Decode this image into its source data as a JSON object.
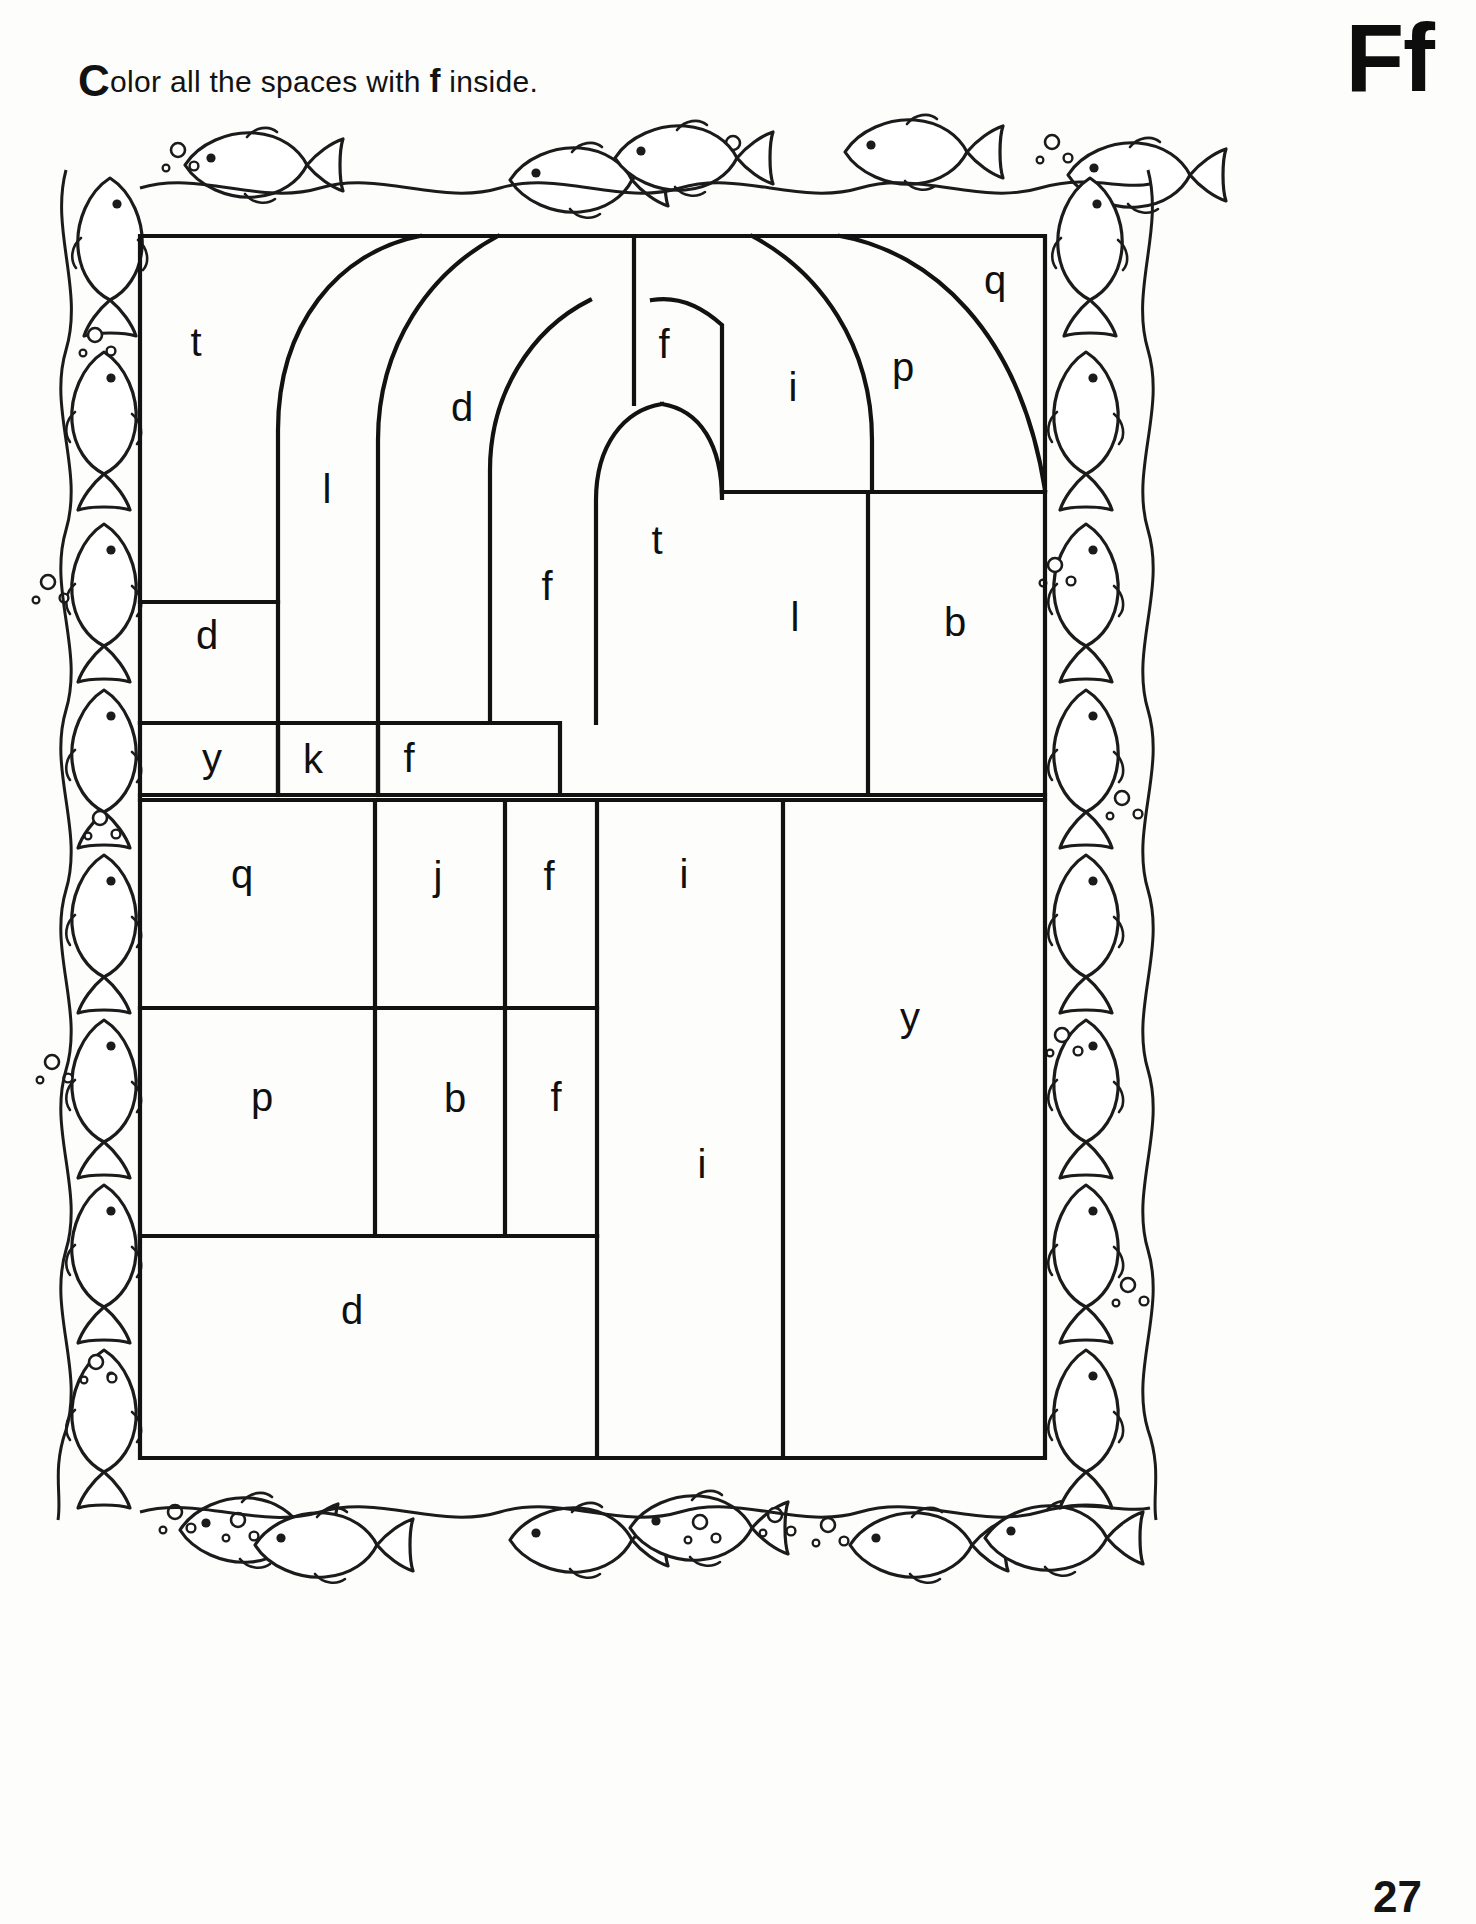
{
  "worksheet": {
    "instruction_lead": "C",
    "instruction_before": "olor all the spaces with ",
    "instruction_target": "f",
    "instruction_after": " inside.",
    "instruction_full": "Color all the spaces with f inside.",
    "letter_pair": "Ff",
    "target_letter": "f",
    "page_number": "27",
    "ink_color": "#101010",
    "paper_color": "#fdfdfc"
  },
  "border": {
    "name": "fish-and-bubbles-border",
    "motif": "fish",
    "bubble_motif": "circle"
  },
  "puzzle": {
    "name": "color-by-letter-arch-grid",
    "frame": {
      "x": 140,
      "y": 236,
      "width": 905,
      "height": 1222
    },
    "cells": [
      {
        "id": "c-t-top-left",
        "letter": "t",
        "x": 196,
        "y": 345
      },
      {
        "id": "c-l-arch-outer",
        "letter": "l",
        "x": 327,
        "y": 492
      },
      {
        "id": "c-d-arch-mid",
        "letter": "d",
        "x": 462,
        "y": 410
      },
      {
        "id": "c-f-arch-inner",
        "letter": "f",
        "x": 547,
        "y": 589
      },
      {
        "id": "c-f-top-center",
        "letter": "f",
        "x": 664,
        "y": 347
      },
      {
        "id": "c-t-arch-core",
        "letter": "t",
        "x": 657,
        "y": 543
      },
      {
        "id": "c-i-upper-right",
        "letter": "i",
        "x": 793,
        "y": 390
      },
      {
        "id": "c-p-upper-right",
        "letter": "p",
        "x": 903,
        "y": 370
      },
      {
        "id": "c-q-corner",
        "letter": "q",
        "x": 995,
        "y": 283
      },
      {
        "id": "c-l-right-mid",
        "letter": "l",
        "x": 795,
        "y": 620
      },
      {
        "id": "c-b-right-mid",
        "letter": "b",
        "x": 955,
        "y": 625
      },
      {
        "id": "c-d-left-mid",
        "letter": "d",
        "x": 207,
        "y": 638
      },
      {
        "id": "c-y-strip",
        "letter": "y",
        "x": 212,
        "y": 761
      },
      {
        "id": "c-k-strip",
        "letter": "k",
        "x": 313,
        "y": 762
      },
      {
        "id": "c-f-strip",
        "letter": "f",
        "x": 409,
        "y": 761
      },
      {
        "id": "c-q-row3",
        "letter": "q",
        "x": 242,
        "y": 877
      },
      {
        "id": "c-j-row3",
        "letter": "j",
        "x": 438,
        "y": 879
      },
      {
        "id": "c-f-row3",
        "letter": "f",
        "x": 549,
        "y": 879
      },
      {
        "id": "c-i-row3",
        "letter": "i",
        "x": 684,
        "y": 877
      },
      {
        "id": "c-y-tall-right",
        "letter": "y",
        "x": 910,
        "y": 1020
      },
      {
        "id": "c-p-row4",
        "letter": "p",
        "x": 262,
        "y": 1100
      },
      {
        "id": "c-b-row4",
        "letter": "b",
        "x": 455,
        "y": 1101
      },
      {
        "id": "c-f-row4",
        "letter": "f",
        "x": 556,
        "y": 1100
      },
      {
        "id": "c-i-tall-row4",
        "letter": "i",
        "x": 702,
        "y": 1167
      },
      {
        "id": "c-d-bottom",
        "letter": "d",
        "x": 352,
        "y": 1313
      }
    ],
    "letters_used": [
      "t",
      "l",
      "d",
      "f",
      "i",
      "p",
      "q",
      "b",
      "y",
      "k",
      "j"
    ]
  }
}
